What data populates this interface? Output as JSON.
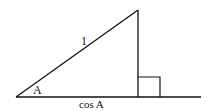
{
  "diagram": {
    "type": "right-triangle",
    "labels": {
      "angle": "A",
      "hypotenuse": "1",
      "base": "cos A"
    },
    "colors": {
      "stroke": "#111111",
      "background": "#ffffff"
    }
  }
}
